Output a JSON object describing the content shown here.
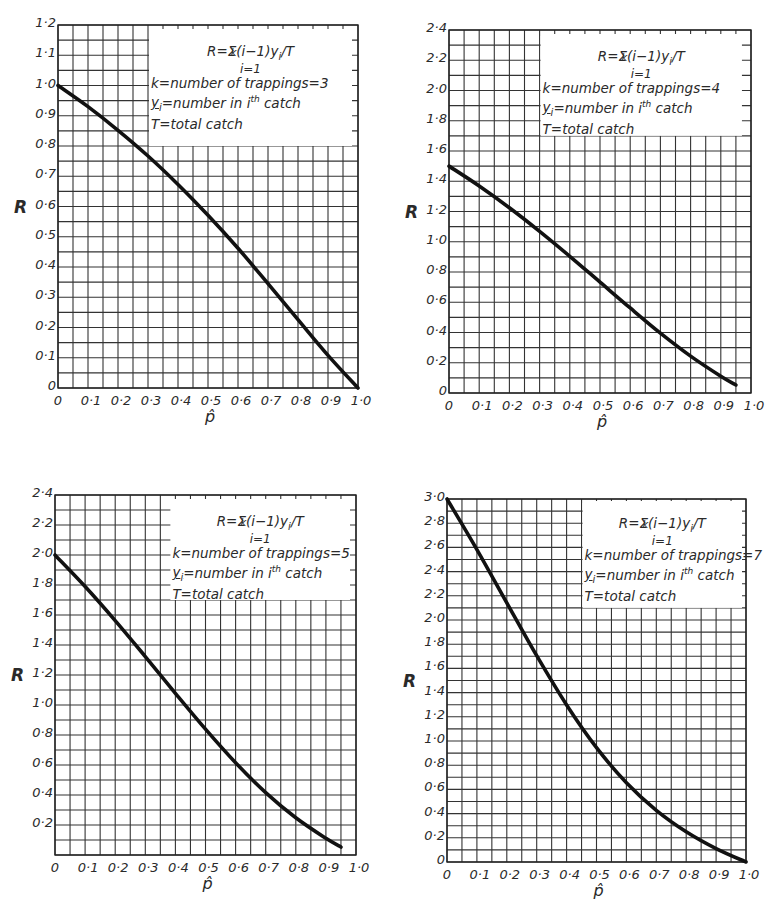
{
  "figure": {
    "axis_label_y": "R",
    "axis_label_x": "p̂",
    "formula": {
      "lhs": "R=",
      "sigma": "Σ",
      "upper": "k",
      "body": "(i−1)y",
      "sub": "i",
      "tail": "/T",
      "lower": "i=1"
    },
    "legend_lines": {
      "k_prefix": "k=number of trappings=",
      "y_line_a": "y",
      "y_line_sub": "i",
      "y_line_b": "=number in i",
      "y_line_sup": "th",
      "y_line_c": " catch",
      "t_line": "T=total catch"
    }
  },
  "chart_data": [
    {
      "type": "line",
      "title": "k = 3",
      "k": "3",
      "xlabel": "p̂",
      "ylabel": "R",
      "xlim": [
        0,
        1.0
      ],
      "ylim": [
        0,
        1.2
      ],
      "x_ticks": [
        "0",
        "0·1",
        "0·2",
        "0·3",
        "0·4",
        "0·5",
        "0·6",
        "0·7",
        "0·8",
        "0·9",
        "1·0"
      ],
      "y_ticks": [
        "0",
        "0·1",
        "0·2",
        "0·3",
        "0·4",
        "0·5",
        "0·6",
        "0·7",
        "0·8",
        "0·9",
        "1·0",
        "1·1",
        "1·2"
      ],
      "y_tick_step": 0.1,
      "grid": true,
      "x": [
        0,
        0.1,
        0.2,
        0.3,
        0.4,
        0.5,
        0.6,
        0.7,
        0.8,
        0.9,
        1.0
      ],
      "series": [
        {
          "name": "R",
          "values": [
            1.0,
            0.93,
            0.852,
            0.767,
            0.673,
            0.571,
            0.462,
            0.345,
            0.226,
            0.108,
            0.0
          ]
        }
      ]
    },
    {
      "type": "line",
      "title": "k = 4",
      "k": "4",
      "xlabel": "p̂",
      "ylabel": "R",
      "xlim": [
        0,
        1.0
      ],
      "ylim": [
        0,
        2.4
      ],
      "x_ticks": [
        "0",
        "0·1",
        "0·2",
        "0·3",
        "0·4",
        "0·5",
        "0·6",
        "0·7",
        "0·8",
        "0·9",
        "1·0"
      ],
      "y_ticks": [
        "0",
        "0·2",
        "0·4",
        "0·6",
        "0·8",
        "1·0",
        "1·2",
        "1·4",
        "1·6",
        "1·8",
        "2·0",
        "2·2",
        "2·4"
      ],
      "y_tick_step": 0.2,
      "grid": true,
      "x": [
        0,
        0.1,
        0.2,
        0.3,
        0.4,
        0.5,
        0.6,
        0.7,
        0.8,
        0.9,
        0.95
      ],
      "series": [
        {
          "name": "R",
          "values": [
            1.5,
            1.369,
            1.225,
            1.069,
            0.904,
            0.733,
            0.562,
            0.396,
            0.244,
            0.111,
            0.053
          ]
        }
      ]
    },
    {
      "type": "line",
      "title": "k = 5",
      "k": "5",
      "xlabel": "p̂",
      "ylabel": "R",
      "xlim": [
        0,
        1.0
      ],
      "ylim": [
        0,
        2.4
      ],
      "x_ticks": [
        "0",
        "0·1",
        "0·2",
        "0·3",
        "0·4",
        "0·5",
        "0·6",
        "0·7",
        "0·8",
        "0·9",
        "1·0"
      ],
      "y_ticks": [
        "",
        "0·2",
        "0·4",
        "0·6",
        "0·8",
        "1·0",
        "1·2",
        "1·4",
        "1·6",
        "1·8",
        "2·0",
        "2·2",
        "2·4"
      ],
      "y_tick_step": 0.2,
      "grid": true,
      "x": [
        0,
        0.1,
        0.2,
        0.3,
        0.4,
        0.5,
        0.6,
        0.7,
        0.8,
        0.9,
        0.95
      ],
      "series": [
        {
          "name": "R",
          "values": [
            2.0,
            1.79,
            1.563,
            1.323,
            1.078,
            0.839,
            0.615,
            0.416,
            0.248,
            0.111,
            0.053
          ]
        }
      ]
    },
    {
      "type": "line",
      "title": "k = 7",
      "k": "7",
      "xlabel": "p̂",
      "ylabel": "R",
      "xlim": [
        0,
        1.0
      ],
      "ylim": [
        0,
        3.0
      ],
      "x_ticks": [
        "0",
        "0·1",
        "0·2",
        "0·3",
        "0·4",
        "0·5",
        "0·6",
        "0·7",
        "0·8",
        "0·9",
        "1·0"
      ],
      "y_ticks": [
        "0",
        "0·2",
        "0·4",
        "0·6",
        "0·8",
        "1·0",
        "1·2",
        "1·4",
        "1·6",
        "1·8",
        "2·0",
        "2·2",
        "2·4",
        "2·6",
        "2·8",
        "3·0"
      ],
      "y_tick_step": 0.2,
      "grid": true,
      "x": [
        0,
        0.1,
        0.2,
        0.3,
        0.4,
        0.5,
        0.6,
        0.7,
        0.8,
        0.9,
        1.0
      ],
      "series": [
        {
          "name": "R",
          "values": [
            3.0,
            2.582,
            2.142,
            1.705,
            1.298,
            0.945,
            0.655,
            0.427,
            0.25,
            0.111,
            0.0
          ]
        }
      ]
    }
  ]
}
